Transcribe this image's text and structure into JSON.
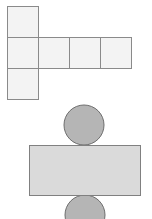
{
  "diagram": {
    "colors": {
      "square_fill": "#f3f3f3",
      "square_stroke": "#8a8a8a",
      "circle_fill": "#b5b5b5",
      "circle_stroke": "#6e6e6e",
      "rect_fill": "#dadada",
      "rect_stroke": "#808080"
    },
    "cube_net": {
      "cell_size": 31,
      "squares": [
        {
          "x": 7,
          "y": 6
        },
        {
          "x": 7,
          "y": 37
        },
        {
          "x": 38,
          "y": 37
        },
        {
          "x": 69,
          "y": 37
        },
        {
          "x": 100,
          "y": 37
        },
        {
          "x": 7,
          "y": 68
        }
      ]
    },
    "cylinder_net": {
      "top_circle": {
        "cx": 84,
        "cy": 125,
        "r": 20
      },
      "rectangle": {
        "x": 29,
        "y": 145,
        "width": 111,
        "height": 50
      },
      "bottom_circle": {
        "cx": 85,
        "cy": 215,
        "r": 20
      }
    }
  }
}
